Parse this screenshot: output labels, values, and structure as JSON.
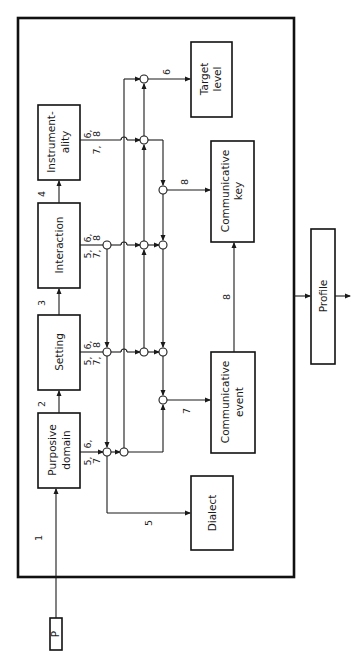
{
  "diagram": {
    "orientation": "rotated-90-ccw",
    "colors": {
      "ink": "#1a1a1a",
      "background": "#ffffff"
    },
    "nodes": {
      "p": {
        "label": "P"
      },
      "purposive_domain": {
        "label_line1": "Purposive",
        "label_line2": "domain"
      },
      "setting": {
        "label": "Setting"
      },
      "interaction": {
        "label": "Interaction"
      },
      "instrumentality": {
        "label_line1": "Instrument-",
        "label_line2": "ality"
      },
      "dialect": {
        "label": "Dialect"
      },
      "communicative_event": {
        "label_line1": "Communicative",
        "label_line2": "event"
      },
      "communicative_key": {
        "label_line1": "Communicative",
        "label_line2": "key"
      },
      "target_level": {
        "label_line1": "Target",
        "label_line2": "level"
      },
      "profile": {
        "label": "Profile"
      }
    },
    "edges": {
      "p_to_purposive": "1",
      "purposive_to_setting": "2",
      "setting_to_interaction": "3",
      "interaction_to_instrumentality": "4",
      "to_dialect": "5",
      "to_target_level": "6",
      "to_communicative_event": "7",
      "event_to_key": "8",
      "to_communicative_key": "8"
    },
    "output_labels": {
      "purposive_a": "6,",
      "purposive_b": "5,",
      "purposive_c": "7",
      "setting_a": "6,",
      "setting_b": "8",
      "setting_c": "5,",
      "setting_d": "7,",
      "interaction_a": "6,",
      "interaction_b": "8",
      "interaction_c": "5,",
      "interaction_d": "7,",
      "instrumentality_a": "6,",
      "instrumentality_b": "8",
      "instrumentality_c": "7,"
    }
  }
}
